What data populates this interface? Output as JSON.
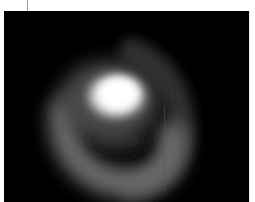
{
  "image": {
    "subject": "glowing spiral structure on black background",
    "palette": {
      "background": "#000000",
      "core": "#ffffff",
      "arm": "#5a5a5a",
      "outer_arm": "#2e2e2e",
      "frame": "#ffffff",
      "tick": "#9a9a9a"
    }
  }
}
